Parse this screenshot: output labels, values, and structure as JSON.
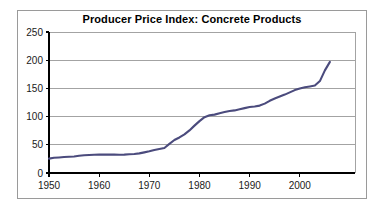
{
  "chart_data": {
    "type": "line",
    "title": "Producer Price Index: Concrete Products",
    "xlabel": "",
    "ylabel": "",
    "xlim": [
      1950,
      2011
    ],
    "ylim": [
      0,
      250
    ],
    "grid": "horizontal",
    "legend": "none",
    "line_color": "#4b4b7d",
    "x_ticks": [
      "1950",
      "1960",
      "1970",
      "1980",
      "1990",
      "2000"
    ],
    "x_tick_values": [
      1950,
      1960,
      1970,
      1980,
      1990,
      2000
    ],
    "y_ticks": [
      "0",
      "50",
      "100",
      "150",
      "200",
      "250"
    ],
    "y_tick_values": [
      0,
      50,
      100,
      150,
      200,
      250
    ],
    "series": [
      {
        "name": "Producer Price Index: Concrete Products",
        "x": [
          1950,
          1951,
          1952,
          1953,
          1954,
          1955,
          1956,
          1957,
          1958,
          1959,
          1960,
          1961,
          1962,
          1963,
          1964,
          1965,
          1966,
          1967,
          1968,
          1969,
          1970,
          1971,
          1972,
          1973,
          1974,
          1975,
          1976,
          1977,
          1978,
          1979,
          1980,
          1981,
          1982,
          1983,
          1984,
          1985,
          1986,
          1987,
          1988,
          1989,
          1990,
          1991,
          1992,
          1993,
          1994,
          1995,
          1996,
          1997,
          1998,
          1999,
          2000,
          2001,
          2002,
          2003,
          2004,
          2005,
          2006
        ],
        "values": [
          25.5,
          27.0,
          27.6,
          28.3,
          28.7,
          29.3,
          30.6,
          31.6,
          32.0,
          32.4,
          32.6,
          32.5,
          32.6,
          32.5,
          32.3,
          32.6,
          33.2,
          33.6,
          34.8,
          36.6,
          38.4,
          40.8,
          42.5,
          44.3,
          51.6,
          58.5,
          63.0,
          68.5,
          75.5,
          84.0,
          92.0,
          99.0,
          102.5,
          103.5,
          106.0,
          108.0,
          110.0,
          111.0,
          113.0,
          115.0,
          117.0,
          118.0,
          119.5,
          123.0,
          128.0,
          132.0,
          135.5,
          139.0,
          143.0,
          147.0,
          150.0,
          152.0,
          153.5,
          155.0,
          163.0,
          182.0,
          197.0
        ]
      }
    ]
  },
  "title": {
    "text": "Producer Price Index: Concrete Products"
  }
}
